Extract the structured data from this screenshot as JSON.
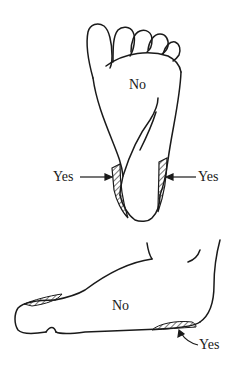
{
  "diagram": {
    "plantar_view": {
      "region_label": "No",
      "left_heel_label": "Yes",
      "right_heel_label": "Yes"
    },
    "lateral_view": {
      "region_label": "No",
      "heel_label": "Yes"
    }
  },
  "colors": {
    "ink": "#1a1a1a",
    "background": "#ffffff"
  }
}
